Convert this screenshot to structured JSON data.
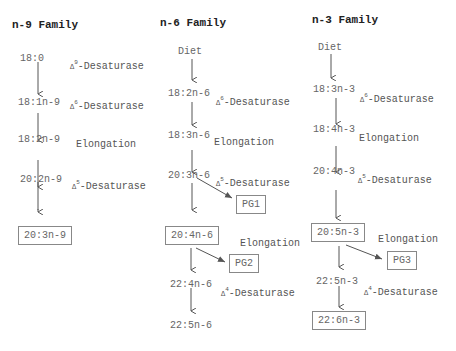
{
  "families": [
    {
      "title": "n-9 Family",
      "nodes": [
        "18:0",
        "18:1n-9",
        "18:2n-9",
        "20:2n-9",
        "20:3n-9"
      ],
      "steps": [
        {
          "enzyme": "-Desaturase",
          "delta": "9"
        },
        {
          "enzyme": "-Desaturase",
          "delta": "6"
        },
        {
          "enzyme": "Elongation",
          "delta": ""
        },
        {
          "enzyme": "-Desaturase",
          "delta": "5"
        }
      ]
    },
    {
      "title": "n-6 Family",
      "nodes": [
        "Diet",
        "18:2n-6",
        "18:3n-6",
        "20:3n-6",
        "20:4n-6",
        "22:4n-6",
        "22:5n-6"
      ],
      "steps": [
        {
          "enzyme": "-Desaturase",
          "delta": "6"
        },
        {
          "enzyme": "Elongation",
          "delta": ""
        },
        {
          "enzyme": "-Desaturase",
          "delta": "5"
        },
        {
          "enzyme": "Elongation",
          "delta": ""
        },
        {
          "enzyme": "-Desaturase",
          "delta": "4"
        }
      ],
      "prostaglandins": [
        "PG1",
        "PG2"
      ]
    },
    {
      "title": "n-3 Family",
      "nodes": [
        "Diet",
        "18:3n-3",
        "18:4n-3",
        "20:4n-3",
        "20:5n-3",
        "22:5n-3",
        "22:6n-3"
      ],
      "steps": [
        {
          "enzyme": "-Desaturase",
          "delta": "6"
        },
        {
          "enzyme": "Elongation",
          "delta": ""
        },
        {
          "enzyme": "-Desaturase",
          "delta": "5"
        },
        {
          "enzyme": "Elongation",
          "delta": ""
        },
        {
          "enzyme": "-Desaturase",
          "delta": "4"
        }
      ],
      "prostaglandins": [
        "PG3"
      ]
    }
  ],
  "symbols": {
    "delta": "Δ"
  }
}
